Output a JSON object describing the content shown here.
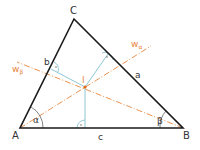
{
  "diagram": {
    "vertices": {
      "A": {
        "label": "A",
        "x": 20,
        "y": 128
      },
      "B": {
        "label": "B",
        "x": 183,
        "y": 128
      },
      "C": {
        "label": "C",
        "x": 74,
        "y": 19
      }
    },
    "sides": {
      "a": {
        "label": "a"
      },
      "b": {
        "label": "b"
      },
      "c": {
        "label": "c"
      }
    },
    "angles": {
      "alpha": {
        "label": "α"
      },
      "beta": {
        "label": "β"
      }
    },
    "bisectors": {
      "w_alpha": {
        "label": "w",
        "subscript": "α"
      },
      "w_beta": {
        "label": "w",
        "subscript": "β"
      }
    },
    "incenter": {
      "label": "I",
      "x": 85,
      "y": 87
    },
    "right_angle_marker": "·",
    "colors": {
      "triangle": "#1a1a1a",
      "bisector": "#e8863a",
      "perpendicular": "#7fbfcf",
      "incenter": "#e06a1a",
      "arc": "#666666"
    }
  }
}
